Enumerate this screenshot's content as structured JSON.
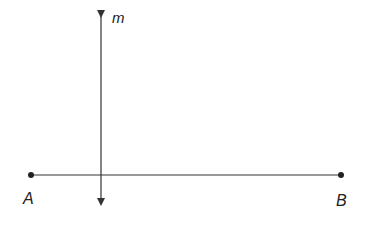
{
  "diagram": {
    "colors": {
      "stroke": "#333333",
      "point": "#222222",
      "label": "#222222",
      "background": "#ffffff"
    },
    "segment": {
      "name": "AB",
      "endpoints": [
        {
          "label": "A",
          "x": 31,
          "y": 175
        },
        {
          "label": "B",
          "x": 341,
          "y": 175
        }
      ]
    },
    "line_m": {
      "label": "m",
      "x": 101,
      "y_top": 8,
      "y_bottom": 208,
      "arrows": [
        "up",
        "down"
      ]
    },
    "labels": {
      "point_a": "A",
      "point_b": "B",
      "line": "m"
    }
  }
}
